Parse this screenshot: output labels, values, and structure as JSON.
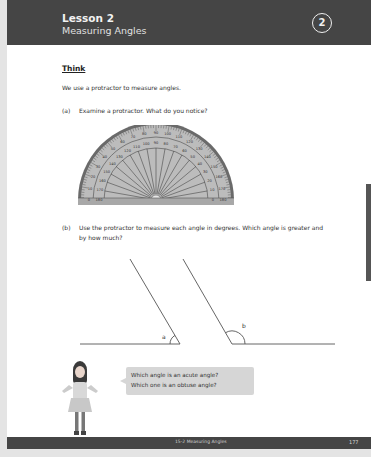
{
  "header": {
    "lesson_number": "Lesson 2",
    "lesson_title": "Measuring Angles",
    "badge": "2"
  },
  "section": {
    "heading": "Think",
    "intro": "We use a protractor to measure angles."
  },
  "questions": [
    {
      "label": "(a)",
      "text": "Examine a protractor. What do you notice?"
    },
    {
      "label": "(b)",
      "text": "Use the protractor to measure each angle in degrees. Which angle is greater and by how much?"
    }
  ],
  "protractor": {
    "outer_scale": [
      "0",
      "10",
      "20",
      "30",
      "40",
      "50",
      "60",
      "70",
      "80",
      "90",
      "100",
      "110",
      "120",
      "130",
      "140",
      "150",
      "160",
      "170",
      "180"
    ],
    "inner_scale": [
      "180",
      "170",
      "160",
      "150",
      "140",
      "130",
      "120",
      "110",
      "100",
      "90",
      "80",
      "70",
      "60",
      "50",
      "40",
      "30",
      "20",
      "10",
      "0"
    ]
  },
  "angles": [
    {
      "label": "a",
      "type": "acute"
    },
    {
      "label": "b",
      "type": "obtuse"
    }
  ],
  "speech_bubble": {
    "line1": "Which angle is an acute angle?",
    "line2": "Which one is an obtuse angle?"
  },
  "footer": {
    "section_title": "15-2 Measuring Angles",
    "page_number": "177"
  },
  "colors": {
    "header_bg": "#454545",
    "page_bg": "#ffffff",
    "margin_bg": "#e4e4e4",
    "protractor_fill": "#b8b8b8",
    "bubble_bg": "#d6d6d6"
  }
}
